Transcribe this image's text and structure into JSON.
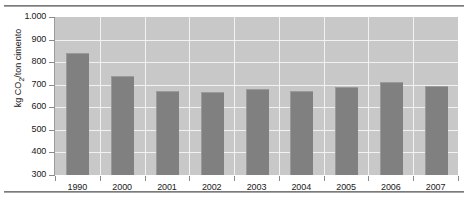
{
  "chart_data": {
    "type": "bar",
    "title": "",
    "subtitle": "",
    "xlabel": "",
    "ylabel": "kg CO2/ton cimento",
    "ylabel_parts": {
      "pre": "kg CO",
      "sub": "2",
      "post": "/ton cimento"
    },
    "categories": [
      "1990",
      "2000",
      "2001",
      "2002",
      "2003",
      "2004",
      "2005",
      "2006",
      "2007"
    ],
    "values": [
      835,
      735,
      668,
      663,
      675,
      670,
      685,
      707,
      688
    ],
    "series": [
      {
        "name": "kg CO2/ton cimento",
        "values": [
          835,
          735,
          668,
          663,
          675,
          670,
          685,
          707,
          688
        ],
        "color": "#808080"
      }
    ],
    "ylim": [
      300,
      1000
    ],
    "yticks": [
      300,
      400,
      500,
      600,
      700,
      800,
      900,
      1000
    ],
    "ytick_labels": [
      "300",
      "400",
      "500",
      "600",
      "700",
      "800",
      "900",
      "1.000"
    ],
    "grid": true,
    "grid_color": "#f2f2f2",
    "legend": false,
    "legend_position": "none",
    "plot_background": "#c8c8c8",
    "bar_color": "#808080",
    "axis_color": "#9c9c9c",
    "text_color": "#1a1a1a"
  }
}
